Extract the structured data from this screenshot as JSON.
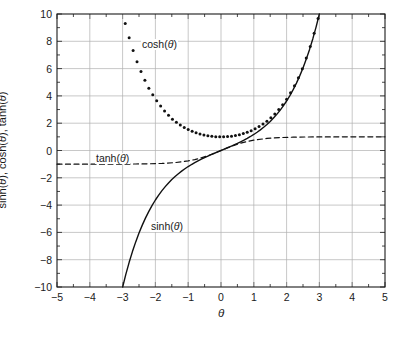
{
  "chart_data": {
    "type": "line",
    "title": "",
    "xlabel": "θ",
    "ylabel": "sinh(θ), cosh(θ), tanh(θ)",
    "xlim": [
      -5,
      5
    ],
    "ylim": [
      -10,
      10
    ],
    "grid": true,
    "legend_position": "inline-annotations",
    "xticks": [
      -5,
      -4,
      -3,
      -2,
      -1,
      0,
      1,
      2,
      3,
      4,
      5
    ],
    "xtick_labels": [
      "−5",
      "−4",
      "−3",
      "−2",
      "−1",
      "0",
      "1",
      "2",
      "3",
      "4",
      "5"
    ],
    "xminor_step": 0.5,
    "yticks": [
      -10,
      -8,
      -6,
      -4,
      -2,
      0,
      2,
      4,
      6,
      8,
      10
    ],
    "ytick_labels": [
      "−10",
      "−8",
      "−6",
      "−4",
      "−2",
      "0",
      "2",
      "4",
      "6",
      "8",
      "10"
    ],
    "yminor_step": 1,
    "series": [
      {
        "name": "sinh(θ)",
        "style": "solid",
        "color": "#111111",
        "annotation": "sinh(θ)",
        "x": [
          -2.9982,
          -2.9,
          -2.8,
          -2.7,
          -2.6,
          -2.5,
          -2.4,
          -2.3,
          -2.2,
          -2.1,
          -2.0,
          -1.9,
          -1.8,
          -1.7,
          -1.6,
          -1.5,
          -1.4,
          -1.3,
          -1.2,
          -1.1,
          -1.0,
          -0.9,
          -0.8,
          -0.7,
          -0.6,
          -0.5,
          -0.4,
          -0.3,
          -0.2,
          -0.1,
          0.0,
          0.1,
          0.2,
          0.3,
          0.4,
          0.5,
          0.6,
          0.7,
          0.8,
          0.9,
          1.0,
          1.1,
          1.2,
          1.3,
          1.4,
          1.5,
          1.6,
          1.7,
          1.8,
          1.9,
          2.0,
          2.1,
          2.2,
          2.3,
          2.4,
          2.5,
          2.6,
          2.7,
          2.8,
          2.9,
          2.9982
        ],
        "y": [
          -10.0,
          -9.061,
          -8.192,
          -7.406,
          -6.695,
          -6.05,
          -5.466,
          -4.937,
          -4.457,
          -4.022,
          -3.627,
          -3.268,
          -2.942,
          -2.646,
          -2.376,
          -2.129,
          -1.904,
          -1.698,
          -1.509,
          -1.336,
          -1.175,
          -1.027,
          -0.888,
          -0.759,
          -0.637,
          -0.521,
          -0.411,
          -0.305,
          -0.201,
          -0.1,
          0.0,
          0.1,
          0.201,
          0.305,
          0.411,
          0.521,
          0.637,
          0.759,
          0.888,
          1.027,
          1.175,
          1.336,
          1.509,
          1.698,
          1.904,
          2.129,
          2.376,
          2.646,
          2.942,
          3.268,
          3.627,
          4.022,
          4.457,
          4.937,
          5.466,
          6.05,
          6.695,
          7.406,
          8.192,
          9.061,
          10.0
        ]
      },
      {
        "name": "cosh(θ)",
        "style": "dotted-markers",
        "color": "#111111",
        "annotation": "cosh(θ)",
        "x": [
          -2.92,
          -2.8,
          -2.68,
          -2.56,
          -2.44,
          -2.32,
          -2.2,
          -2.08,
          -1.96,
          -1.84,
          -1.72,
          -1.6,
          -1.48,
          -1.36,
          -1.24,
          -1.12,
          -1.0,
          -0.88,
          -0.76,
          -0.64,
          -0.52,
          -0.4,
          -0.28,
          -0.16,
          -0.04,
          0.08,
          0.2,
          0.32,
          0.44,
          0.56,
          0.68,
          0.8,
          0.92,
          1.04,
          1.16,
          1.28,
          1.4,
          1.52,
          1.64,
          1.76,
          1.88,
          2.0,
          2.12,
          2.24,
          2.36,
          2.48,
          2.6,
          2.72,
          2.84,
          2.96
        ],
        "y": [
          9.303,
          8.253,
          7.327,
          6.51,
          5.788,
          5.151,
          4.568,
          4.084,
          3.639,
          3.253,
          2.898,
          2.577,
          2.295,
          2.073,
          1.872,
          1.692,
          1.543,
          1.404,
          1.297,
          1.208,
          1.137,
          1.081,
          1.039,
          1.013,
          1.001,
          1.003,
          1.02,
          1.052,
          1.098,
          1.16,
          1.238,
          1.337,
          1.455,
          1.596,
          1.761,
          1.944,
          2.151,
          2.398,
          2.678,
          2.995,
          3.351,
          3.762,
          4.225,
          4.742,
          5.332,
          5.98,
          6.769,
          7.623,
          8.585,
          9.674
        ]
      },
      {
        "name": "tanh(θ)",
        "style": "dashed",
        "color": "#111111",
        "annotation": "tanh(θ)",
        "x": [
          -5.0,
          -4.6,
          -4.2,
          -3.8,
          -3.4,
          -3.0,
          -2.6,
          -2.2,
          -1.8,
          -1.4,
          -1.0,
          -0.8,
          -0.6,
          -0.4,
          -0.2,
          0.0,
          0.2,
          0.4,
          0.6,
          0.8,
          1.0,
          1.4,
          1.8,
          2.2,
          2.6,
          3.0,
          3.4,
          3.8,
          4.2,
          4.6,
          5.0
        ],
        "y": [
          -0.9999,
          -0.9998,
          -0.9996,
          -0.999,
          -0.9978,
          -0.995,
          -0.9889,
          -0.9757,
          -0.9468,
          -0.8854,
          -0.7616,
          -0.664,
          -0.537,
          -0.3799,
          -0.1974,
          0.0,
          0.1974,
          0.3799,
          0.537,
          0.664,
          0.7616,
          0.8854,
          0.9468,
          0.9757,
          0.9889,
          0.995,
          0.9978,
          0.999,
          0.9996,
          0.9998,
          0.9999
        ]
      }
    ],
    "annotations": [
      {
        "text": "cosh(θ)",
        "x": -1.4,
        "y": 8.2
      },
      {
        "text": "tanh(θ)",
        "x": -3.6,
        "y": 0.0
      },
      {
        "text": "sinh(θ)",
        "x": -1.7,
        "y": -5.0
      }
    ],
    "colors": {
      "grid": "#b0b0b0",
      "axis": "#1a1a1a",
      "curve": "#111111",
      "background": "#ffffff"
    }
  }
}
